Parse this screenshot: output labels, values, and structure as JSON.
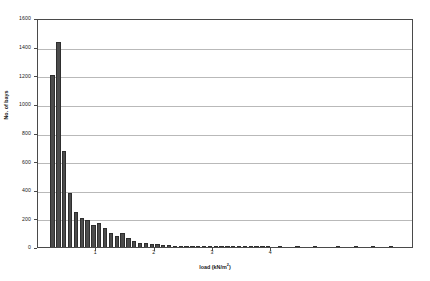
{
  "chart_data": {
    "type": "bar",
    "title": "",
    "subtitle": "",
    "xlabel": "load (kN/m",
    "xlabel_sup": "2",
    "xlabel_tail": ")",
    "xlabel_full": "load (kN/m2)",
    "ylabel": "No. of bays",
    "xlim": [
      0,
      6.45
    ],
    "ylim": [
      0,
      1600
    ],
    "grid": "horizontal",
    "legend": "none",
    "bar_color": "#4c4c4c",
    "bar_edge_color": "#2e2e2e",
    "gridline_color": "#b9b9b9",
    "axis_color": "#4a4a4a",
    "yticks": [
      0,
      200,
      400,
      600,
      800,
      1000,
      1200,
      1400,
      1600
    ],
    "ytick_labels": [
      "0",
      "200",
      "400",
      "600",
      "800",
      "1000",
      "1200",
      "1400",
      "1600"
    ],
    "xticks": [
      1,
      2,
      3,
      4
    ],
    "xtick_labels": [
      "1",
      "2",
      "3",
      "4"
    ],
    "bin_width": 0.1,
    "x": [
      0.25,
      0.35,
      0.45,
      0.55,
      0.65,
      0.75,
      0.85,
      0.95,
      1.05,
      1.15,
      1.25,
      1.35,
      1.45,
      1.55,
      1.65,
      1.75,
      1.85,
      1.95,
      2.05,
      2.15,
      2.25,
      2.35,
      2.45,
      2.55,
      2.65,
      2.75,
      2.85,
      2.95,
      3.05,
      3.15,
      3.25,
      3.35,
      3.45,
      3.55,
      3.65,
      3.75,
      3.85,
      3.95,
      4.15,
      4.45,
      4.75,
      5.15,
      5.45,
      5.75,
      6.05
    ],
    "values": [
      1205,
      1430,
      670,
      375,
      245,
      200,
      190,
      155,
      170,
      130,
      95,
      80,
      100,
      60,
      42,
      30,
      25,
      20,
      18,
      14,
      12,
      10,
      9,
      8,
      7,
      6,
      5,
      5,
      4,
      4,
      3,
      3,
      3,
      2,
      2,
      2,
      2,
      2,
      3,
      2,
      2,
      3,
      2,
      2,
      2
    ],
    "categories": [
      "0.25",
      "0.35",
      "0.45",
      "0.55",
      "0.65",
      "0.75",
      "0.85",
      "0.95",
      "1.05",
      "1.15",
      "1.25",
      "1.35",
      "1.45",
      "1.55",
      "1.65",
      "1.75",
      "1.85",
      "1.95",
      "2.05",
      "2.15",
      "2.25",
      "2.35",
      "2.45",
      "2.55",
      "2.65",
      "2.75",
      "2.85",
      "2.95",
      "3.05",
      "3.15",
      "3.25",
      "3.35",
      "3.45",
      "3.55",
      "3.65",
      "3.75",
      "3.85",
      "3.95",
      "4.15",
      "4.45",
      "4.75",
      "5.15",
      "5.45",
      "5.75",
      "6.05"
    ]
  }
}
